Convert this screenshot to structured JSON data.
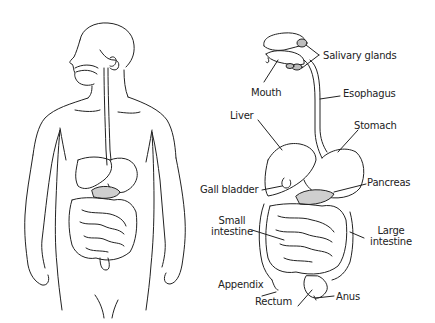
{
  "diagram": {
    "colors": {
      "line": "#222222",
      "pancreas_fill": "#cfcfcf",
      "gland_fill": "#bdbdbd",
      "background": "#ffffff"
    },
    "labels": {
      "salivary_glands": "Salivary glands",
      "mouth": "Mouth",
      "esophagus": "Esophagus",
      "liver": "Liver",
      "stomach": "Stomach",
      "gall_bladder": "Gall bladder",
      "pancreas": "Pancreas",
      "small_intestine_1": "Small",
      "small_intestine_2": "intestine",
      "large_intestine_1": "Large",
      "large_intestine_2": "intestine",
      "appendix": "Appendix",
      "rectum": "Rectum",
      "anus": "Anus"
    }
  }
}
